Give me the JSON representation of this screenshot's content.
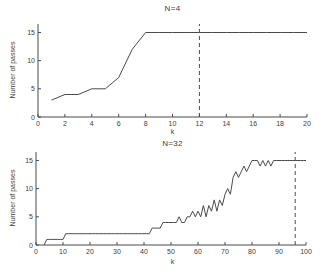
{
  "colors": {
    "line": "#4a4a4a",
    "axis": "#4a4a4a",
    "text": "#3d3d3d",
    "background": "#ffffff"
  },
  "chart_data": [
    {
      "type": "line",
      "title": "N=4",
      "xlabel": "k",
      "ylabel": "Number of passes",
      "xlim": [
        0,
        20
      ],
      "ylim": [
        0,
        16.5
      ],
      "xticks": [
        0,
        2,
        4,
        6,
        8,
        10,
        12,
        14,
        16,
        18,
        20
      ],
      "yticks": [
        0,
        5,
        10,
        15
      ],
      "grid": false,
      "legend": "none",
      "dashed_vline_x": 12,
      "series": [
        {
          "name": "passes",
          "x": [
            1,
            2,
            3,
            4,
            5,
            6,
            7,
            8,
            9,
            10,
            11,
            12,
            13,
            14,
            15,
            16,
            17,
            18,
            19,
            20
          ],
          "y": [
            3,
            4,
            4,
            5,
            5,
            7,
            12,
            15,
            15,
            15,
            15,
            15,
            15,
            15,
            15,
            15,
            15,
            15,
            15,
            15
          ]
        }
      ]
    },
    {
      "type": "line",
      "title": "N=32",
      "xlabel": "k",
      "ylabel": "Number of passes",
      "xlim": [
        0,
        100
      ],
      "ylim": [
        0,
        16.5
      ],
      "xticks": [
        0,
        10,
        20,
        30,
        40,
        50,
        60,
        70,
        80,
        90,
        100
      ],
      "yticks": [
        0,
        5,
        10,
        15
      ],
      "grid": false,
      "legend": "none",
      "dashed_vline_x": 96,
      "series": [
        {
          "name": "passes",
          "x": [
            3,
            4,
            5,
            6,
            7,
            8,
            9,
            10,
            11,
            12,
            13,
            14,
            15,
            16,
            17,
            18,
            19,
            20,
            21,
            22,
            23,
            24,
            25,
            26,
            27,
            28,
            29,
            30,
            31,
            32,
            33,
            34,
            35,
            36,
            37,
            38,
            39,
            40,
            41,
            42,
            43,
            44,
            45,
            46,
            47,
            48,
            49,
            50,
            51,
            52,
            53,
            54,
            55,
            56,
            57,
            58,
            59,
            60,
            61,
            62,
            63,
            64,
            65,
            66,
            67,
            68,
            69,
            70,
            71,
            72,
            73,
            74,
            75,
            76,
            77,
            78,
            79,
            80,
            81,
            82,
            83,
            84,
            85,
            86,
            87,
            88,
            89,
            90,
            91,
            92,
            93,
            94,
            95,
            96,
            97,
            98,
            99,
            100
          ],
          "y": [
            0,
            1,
            1,
            1,
            1,
            1,
            1,
            1,
            2,
            2,
            2,
            2,
            2,
            2,
            2,
            2,
            2,
            2,
            2,
            2,
            2,
            2,
            2,
            2,
            2,
            2,
            2,
            2,
            2,
            2,
            2,
            2,
            2,
            2,
            2,
            2,
            2,
            2,
            2,
            2,
            3,
            3,
            3,
            3,
            4,
            4,
            4,
            4,
            4,
            4,
            5,
            4,
            4,
            5,
            5,
            6,
            5,
            6,
            5,
            7,
            5,
            7,
            6,
            8,
            6,
            8,
            7,
            9,
            10,
            9,
            12,
            13,
            12,
            13,
            14,
            13,
            14,
            15,
            15,
            15,
            14,
            15,
            14,
            15,
            14,
            15,
            15,
            15,
            15,
            15,
            15,
            15,
            15,
            15,
            15,
            15,
            15,
            15
          ]
        }
      ]
    }
  ]
}
